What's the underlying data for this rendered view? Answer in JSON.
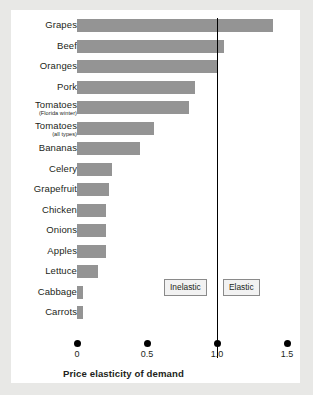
{
  "chart_data": {
    "type": "bar",
    "orientation": "horizontal",
    "title": "",
    "xlabel": "Price elasticity of demand",
    "ylabel": "",
    "xlim": [
      0,
      1.5
    ],
    "xticks": [
      "0",
      "0.5",
      "1.0",
      "1.5"
    ],
    "xtick_values": [
      0,
      0.5,
      1.0,
      1.5
    ],
    "grid": false,
    "legend": "none",
    "bar_color": "#949494",
    "categories": [
      "Grapes",
      "Beef",
      "Oranges",
      "Pork",
      "Tomatoes",
      "Tomatoes",
      "Bananas",
      "Celery",
      "Grapefruit",
      "Chicken",
      "Onions",
      "Apples",
      "Lettuce",
      "Cabbage",
      "Carrots"
    ],
    "category_sublabels": [
      "",
      "",
      "",
      "",
      "(Florida winter)",
      "(all types)",
      "",
      "",
      "",
      "",
      "",
      "",
      "",
      "",
      ""
    ],
    "values": [
      1.4,
      1.05,
      1.0,
      0.84,
      0.8,
      0.55,
      0.45,
      0.25,
      0.23,
      0.21,
      0.21,
      0.21,
      0.15,
      0.04,
      0.04
    ],
    "annotations": [
      {
        "name": "unit-elastic-line",
        "type": "vline",
        "x": 1.0,
        "color": "#000000"
      },
      {
        "name": "inelastic-region",
        "type": "label-box",
        "text": "Inelastic",
        "x": 0.55
      },
      {
        "name": "elastic-region",
        "type": "label-box",
        "text": "Elastic",
        "x": 1.05
      }
    ]
  },
  "axis": {
    "title": "Price elasticity of demand",
    "ticks": [
      {
        "label": "0",
        "value": 0
      },
      {
        "label": "0.5",
        "value": 0.5
      },
      {
        "label": "1.0",
        "value": 1.0
      },
      {
        "label": "1.5",
        "value": 1.5
      }
    ]
  },
  "regions": {
    "inelastic_label": "Inelastic",
    "elastic_label": "Elastic"
  }
}
